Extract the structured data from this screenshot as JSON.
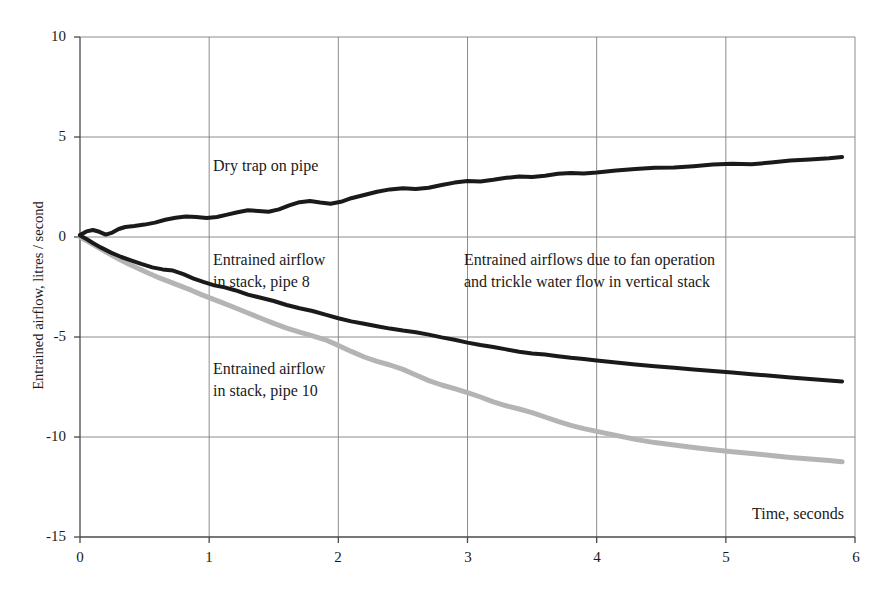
{
  "chart_data": {
    "type": "line",
    "title": "",
    "subtitle": "",
    "xlabel": "Time, seconds",
    "ylabel": "Entrained airflow, litres / second",
    "xlim": [
      0,
      6
    ],
    "ylim": [
      -15,
      10
    ],
    "xticks": [
      0,
      1,
      2,
      3,
      4,
      5,
      6
    ],
    "yticks": [
      10,
      5,
      0,
      -5,
      -10,
      -15
    ],
    "xtick_labels": [
      "0",
      "1",
      "2",
      "3",
      "4",
      "5",
      "6"
    ],
    "ytick_labels": [
      "10",
      "5",
      "0",
      "-5",
      "-10",
      "-15"
    ],
    "grid": true,
    "grid_color": "#808080",
    "legend_position": "inline-annotations",
    "series": [
      {
        "name": "Dry trap on pipe",
        "color": "#1a1a1a",
        "width": 4,
        "x": [
          0.0,
          0.05,
          0.1,
          0.15,
          0.2,
          0.25,
          0.3,
          0.35,
          0.42,
          0.5,
          0.58,
          0.66,
          0.74,
          0.82,
          0.9,
          0.98,
          1.06,
          1.14,
          1.22,
          1.3,
          1.38,
          1.46,
          1.54,
          1.62,
          1.7,
          1.78,
          1.86,
          1.94,
          2.02,
          2.1,
          2.2,
          2.3,
          2.4,
          2.5,
          2.6,
          2.7,
          2.8,
          2.9,
          3.0,
          3.1,
          3.2,
          3.3,
          3.4,
          3.5,
          3.6,
          3.7,
          3.8,
          3.9,
          4.0,
          4.15,
          4.3,
          4.45,
          4.6,
          4.75,
          4.9,
          5.05,
          5.2,
          5.35,
          5.5,
          5.65,
          5.8,
          5.9
        ],
        "y": [
          0.1,
          0.28,
          0.35,
          0.26,
          0.12,
          0.22,
          0.4,
          0.5,
          0.55,
          0.62,
          0.72,
          0.86,
          0.96,
          1.02,
          1.0,
          0.95,
          1.0,
          1.12,
          1.24,
          1.34,
          1.3,
          1.26,
          1.38,
          1.58,
          1.74,
          1.8,
          1.72,
          1.66,
          1.76,
          1.94,
          2.1,
          2.26,
          2.38,
          2.44,
          2.4,
          2.46,
          2.6,
          2.72,
          2.8,
          2.78,
          2.86,
          2.96,
          3.02,
          3.0,
          3.06,
          3.16,
          3.2,
          3.18,
          3.22,
          3.32,
          3.4,
          3.46,
          3.48,
          3.54,
          3.62,
          3.66,
          3.64,
          3.72,
          3.82,
          3.88,
          3.94,
          4.0
        ]
      },
      {
        "name": "Entrained airflow in stack, pipe 8",
        "color": "#1a1a1a",
        "width": 4,
        "x": [
          0.0,
          0.05,
          0.1,
          0.16,
          0.24,
          0.32,
          0.4,
          0.48,
          0.56,
          0.64,
          0.72,
          0.8,
          0.88,
          0.96,
          1.04,
          1.12,
          1.2,
          1.3,
          1.4,
          1.5,
          1.6,
          1.7,
          1.8,
          1.9,
          2.0,
          2.1,
          2.2,
          2.3,
          2.4,
          2.5,
          2.6,
          2.7,
          2.8,
          2.9,
          3.0,
          3.1,
          3.2,
          3.3,
          3.4,
          3.5,
          3.6,
          3.7,
          3.8,
          3.9,
          4.0,
          4.15,
          4.3,
          4.45,
          4.6,
          4.75,
          4.9,
          5.05,
          5.2,
          5.35,
          5.5,
          5.65,
          5.8,
          5.9
        ],
        "y": [
          0.08,
          -0.1,
          -0.3,
          -0.52,
          -0.78,
          -1.0,
          -1.18,
          -1.36,
          -1.52,
          -1.62,
          -1.68,
          -1.86,
          -2.08,
          -2.26,
          -2.42,
          -2.52,
          -2.66,
          -2.88,
          -3.04,
          -3.2,
          -3.4,
          -3.56,
          -3.7,
          -3.88,
          -4.06,
          -4.22,
          -4.34,
          -4.46,
          -4.58,
          -4.68,
          -4.76,
          -4.88,
          -5.02,
          -5.14,
          -5.28,
          -5.4,
          -5.5,
          -5.62,
          -5.74,
          -5.82,
          -5.88,
          -5.96,
          -6.04,
          -6.1,
          -6.18,
          -6.28,
          -6.38,
          -6.46,
          -6.54,
          -6.62,
          -6.7,
          -6.78,
          -6.86,
          -6.94,
          -7.02,
          -7.1,
          -7.18,
          -7.22
        ]
      },
      {
        "name": "Entrained airflow in stack, pipe 10",
        "color": "#b4b4b4",
        "width": 5,
        "x": [
          0.0,
          0.06,
          0.14,
          0.22,
          0.3,
          0.38,
          0.46,
          0.54,
          0.62,
          0.7,
          0.78,
          0.86,
          0.94,
          1.02,
          1.1,
          1.2,
          1.3,
          1.4,
          1.5,
          1.6,
          1.7,
          1.8,
          1.9,
          2.0,
          2.1,
          2.2,
          2.3,
          2.4,
          2.5,
          2.6,
          2.7,
          2.8,
          2.9,
          3.0,
          3.1,
          3.2,
          3.3,
          3.4,
          3.5,
          3.6,
          3.7,
          3.8,
          3.9,
          4.0,
          4.15,
          4.3,
          4.45,
          4.6,
          4.75,
          4.9,
          5.05,
          5.2,
          5.35,
          5.5,
          5.65,
          5.8,
          5.9
        ],
        "y": [
          0.0,
          -0.22,
          -0.52,
          -0.82,
          -1.1,
          -1.36,
          -1.6,
          -1.84,
          -2.06,
          -2.26,
          -2.46,
          -2.66,
          -2.88,
          -3.08,
          -3.28,
          -3.54,
          -3.8,
          -4.06,
          -4.32,
          -4.56,
          -4.76,
          -4.94,
          -5.14,
          -5.42,
          -5.72,
          -6.0,
          -6.22,
          -6.4,
          -6.62,
          -6.9,
          -7.18,
          -7.4,
          -7.58,
          -7.78,
          -8.0,
          -8.24,
          -8.44,
          -8.6,
          -8.78,
          -9.0,
          -9.22,
          -9.42,
          -9.58,
          -9.72,
          -9.92,
          -10.12,
          -10.28,
          -10.4,
          -10.52,
          -10.64,
          -10.74,
          -10.82,
          -10.92,
          -11.02,
          -11.1,
          -11.18,
          -11.24
        ]
      }
    ],
    "annotations": [
      {
        "id": "dry-trap",
        "text": "Dry trap on pipe"
      },
      {
        "id": "pipe8",
        "text": "Entrained airflow\nin stack, pipe 8"
      },
      {
        "id": "pipe10",
        "text": "Entrained airflow\nin stack, pipe 10"
      },
      {
        "id": "caption",
        "text": "Entrained airflows due to fan operation\nand trickle water flow in vertical stack"
      },
      {
        "id": "time",
        "text": "Time, seconds"
      }
    ]
  }
}
